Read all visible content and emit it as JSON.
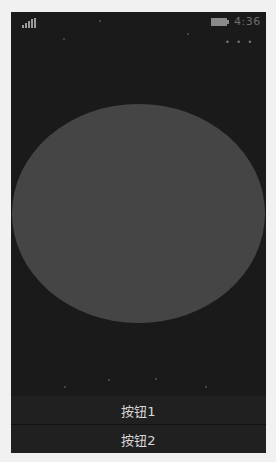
{
  "status_bar": {
    "signal_icon": "signal-bars-icon",
    "battery_icon": "battery-icon",
    "time": "4:36"
  },
  "app_bar": {
    "more_label": "• • •"
  },
  "canvas": {
    "shape": "ellipse",
    "fill_color": "#454545",
    "background_color": "#1a1a1a"
  },
  "buttons": [
    {
      "label": "按钮1"
    },
    {
      "label": "按钮2"
    }
  ]
}
